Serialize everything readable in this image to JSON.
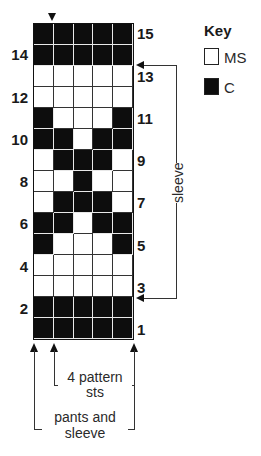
{
  "key": {
    "title": "Key",
    "items": [
      {
        "symbol": "white-square",
        "label": "MS",
        "color": "#ffffff"
      },
      {
        "symbol": "black-square",
        "label": "C",
        "color": "#0d0d0d"
      }
    ]
  },
  "grid": {
    "columns": 5,
    "rows": 15,
    "row_numbering": "bottom-to-top",
    "pattern_top_to_bottom": [
      {
        "row": 15,
        "cells": [
          1,
          1,
          1,
          1,
          1
        ]
      },
      {
        "row": 14,
        "cells": [
          1,
          1,
          1,
          1,
          1
        ]
      },
      {
        "row": 13,
        "cells": [
          0,
          0,
          0,
          0,
          0
        ]
      },
      {
        "row": 12,
        "cells": [
          0,
          0,
          0,
          0,
          0
        ]
      },
      {
        "row": 11,
        "cells": [
          1,
          0,
          0,
          0,
          1
        ]
      },
      {
        "row": 10,
        "cells": [
          1,
          1,
          0,
          1,
          1
        ]
      },
      {
        "row": 9,
        "cells": [
          0,
          1,
          1,
          1,
          0
        ]
      },
      {
        "row": 8,
        "cells": [
          0,
          0,
          1,
          0,
          0
        ]
      },
      {
        "row": 7,
        "cells": [
          0,
          1,
          1,
          1,
          0
        ]
      },
      {
        "row": 6,
        "cells": [
          1,
          1,
          0,
          1,
          1
        ]
      },
      {
        "row": 5,
        "cells": [
          1,
          0,
          0,
          0,
          1
        ]
      },
      {
        "row": 4,
        "cells": [
          0,
          0,
          0,
          0,
          0
        ]
      },
      {
        "row": 3,
        "cells": [
          0,
          0,
          0,
          0,
          0
        ]
      },
      {
        "row": 2,
        "cells": [
          1,
          1,
          1,
          1,
          1
        ]
      },
      {
        "row": 1,
        "cells": [
          1,
          1,
          1,
          1,
          1
        ]
      }
    ],
    "left_labels": [
      "14",
      "12",
      "10",
      "8",
      "6",
      "4",
      "2"
    ],
    "right_labels": [
      "15",
      "13",
      "11",
      "9",
      "7",
      "5",
      "3",
      "1"
    ]
  },
  "annotations": {
    "sleeve_label": "sleeve",
    "sleeve_range": {
      "from_row": 3,
      "to_row": 13
    },
    "pattern_sts_label_line1": "4 pattern",
    "pattern_sts_label_line2": "sts",
    "pants_sleeve_label_line1": "pants and",
    "pants_sleeve_label_line2": "sleeve"
  }
}
